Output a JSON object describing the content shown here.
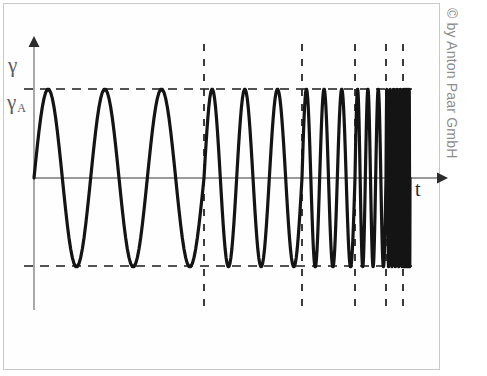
{
  "figure": {
    "copyright": "© by Anton Paar GmbH",
    "frame_color": "#c9c9c9",
    "background": "#ffffff"
  },
  "labels": {
    "y_axis": "γ",
    "y_amplitude": "γ",
    "y_amplitude_sub": "A",
    "x_axis": "t"
  },
  "chart_data": {
    "type": "line",
    "title": "",
    "subtitle": "",
    "xlabel": "t",
    "ylabel": "γ",
    "grid": false,
    "legend": null,
    "annotations": [
      {
        "name": "amplitude-upper",
        "label": "γ_A",
        "y_value": 1,
        "style": "dashed-horizontal"
      },
      {
        "name": "amplitude-lower",
        "label": "-γ_A",
        "y_value": -1,
        "style": "dashed-horizontal"
      }
    ],
    "series": [
      {
        "name": "shear strain chirp",
        "description": "sinusoidal oscillation with constant amplitude and step-wise increasing frequency (frequency sweep)",
        "amplitude": 1,
        "color": "#141414",
        "line_width": 3.2,
        "segments": [
          {
            "index": 1,
            "x_start_px": 34,
            "x_end_px": 204,
            "cycles": 3,
            "relative_frequency": 1
          },
          {
            "index": 2,
            "x_start_px": 204,
            "x_end_px": 302,
            "cycles": 3,
            "relative_frequency": 1.73
          },
          {
            "index": 3,
            "x_start_px": 302,
            "x_end_px": 355,
            "cycles": 3,
            "relative_frequency": 3.2
          },
          {
            "index": 4,
            "x_start_px": 355,
            "x_end_px": 386,
            "cycles": 3,
            "relative_frequency": 5.5
          },
          {
            "index": 5,
            "x_start_px": 386,
            "x_end_px": 403,
            "cycles": 5,
            "relative_frequency": 16.7
          },
          {
            "index": 6,
            "x_start_px": 403,
            "x_end_px": 410,
            "cycles": 7,
            "relative_frequency": 56.7
          }
        ]
      }
    ],
    "ylim": [
      -1.35,
      1.95
    ],
    "xlim_px": [
      34,
      410
    ],
    "marker_lines_px": [
      204,
      302,
      355,
      386,
      403
    ],
    "zero_line_y_px": 178,
    "upper_dashed_y_px": 89,
    "lower_dashed_y_px": 266
  },
  "geometry": {
    "y_axis_x_px": 34,
    "y_axis_top_px": 38,
    "x_axis_end_px": 445,
    "dashed_line_bottom_px": 308,
    "dashed_h_left_px": 24,
    "dashed_h_right_px": 412
  },
  "colors": {
    "curve": "#141414",
    "axis": "#7a7a7a",
    "dashed": "#1a1a1a",
    "label": "#5a5a5a",
    "copyright": "#8d8d8d"
  }
}
